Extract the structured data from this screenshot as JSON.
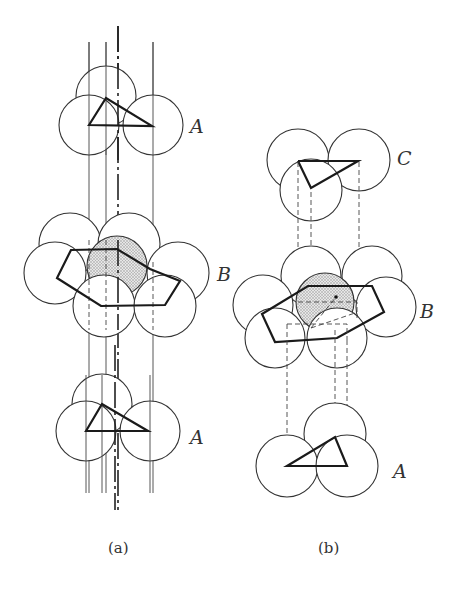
{
  "figure": {
    "panel_a": {
      "caption": "(a)",
      "layers": [
        {
          "label": "A",
          "position": "top"
        },
        {
          "label": "B",
          "position": "middle"
        },
        {
          "label": "A",
          "position": "bottom"
        }
      ],
      "stacking": "ABAB (hexagonal close packing)"
    },
    "panel_b": {
      "caption": "(b)",
      "layers": [
        {
          "label": "C",
          "position": "top"
        },
        {
          "label": "B",
          "position": "middle"
        },
        {
          "label": "A",
          "position": "bottom"
        }
      ],
      "stacking": "ABC (cubic close packing)"
    },
    "colors": {
      "line": "#333333",
      "shading": "#cfcfcf",
      "background": "#ffffff"
    }
  }
}
